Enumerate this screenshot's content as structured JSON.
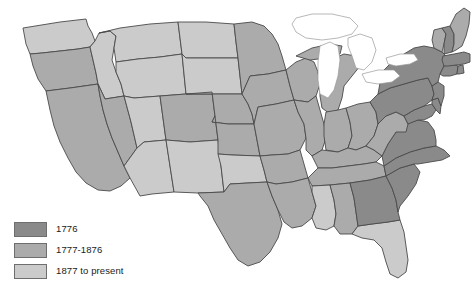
{
  "map": {
    "title": "United States statehood era choropleth",
    "background_color": "#ffffff",
    "border_color": "#4a4a4a",
    "lake_fill": "#ffffff",
    "categories": [
      {
        "key": "era1776",
        "label": "1776",
        "color": "#8a8a8a"
      },
      {
        "key": "era1777",
        "label": "1777-1876",
        "color": "#ababab"
      },
      {
        "key": "era1877",
        "label": "1877 to present",
        "color": "#cbcbcb"
      }
    ],
    "states": [
      {
        "code": "WA",
        "name": "Washington",
        "era": "era1877"
      },
      {
        "code": "OR",
        "name": "Oregon",
        "era": "era1777"
      },
      {
        "code": "CA",
        "name": "California",
        "era": "era1777"
      },
      {
        "code": "ID",
        "name": "Idaho",
        "era": "era1877"
      },
      {
        "code": "NV",
        "name": "Nevada",
        "era": "era1777"
      },
      {
        "code": "MT",
        "name": "Montana",
        "era": "era1877"
      },
      {
        "code": "WY",
        "name": "Wyoming",
        "era": "era1877"
      },
      {
        "code": "UT",
        "name": "Utah",
        "era": "era1877"
      },
      {
        "code": "AZ",
        "name": "Arizona",
        "era": "era1877"
      },
      {
        "code": "CO",
        "name": "Colorado",
        "era": "era1777"
      },
      {
        "code": "NM",
        "name": "New Mexico",
        "era": "era1877"
      },
      {
        "code": "ND",
        "name": "North Dakota",
        "era": "era1877"
      },
      {
        "code": "SD",
        "name": "South Dakota",
        "era": "era1877"
      },
      {
        "code": "NE",
        "name": "Nebraska",
        "era": "era1777"
      },
      {
        "code": "KS",
        "name": "Kansas",
        "era": "era1777"
      },
      {
        "code": "OK",
        "name": "Oklahoma",
        "era": "era1877"
      },
      {
        "code": "TX",
        "name": "Texas",
        "era": "era1777"
      },
      {
        "code": "MN",
        "name": "Minnesota",
        "era": "era1777"
      },
      {
        "code": "IA",
        "name": "Iowa",
        "era": "era1777"
      },
      {
        "code": "MO",
        "name": "Missouri",
        "era": "era1777"
      },
      {
        "code": "AR",
        "name": "Arkansas",
        "era": "era1777"
      },
      {
        "code": "LA",
        "name": "Louisiana",
        "era": "era1777"
      },
      {
        "code": "WI",
        "name": "Wisconsin",
        "era": "era1777"
      },
      {
        "code": "IL",
        "name": "Illinois",
        "era": "era1777"
      },
      {
        "code": "MI",
        "name": "Michigan",
        "era": "era1777"
      },
      {
        "code": "IN",
        "name": "Indiana",
        "era": "era1777"
      },
      {
        "code": "OH",
        "name": "Ohio",
        "era": "era1777"
      },
      {
        "code": "KY",
        "name": "Kentucky",
        "era": "era1777"
      },
      {
        "code": "TN",
        "name": "Tennessee",
        "era": "era1777"
      },
      {
        "code": "MS",
        "name": "Mississippi",
        "era": "era1877"
      },
      {
        "code": "AL",
        "name": "Alabama",
        "era": "era1777"
      },
      {
        "code": "FL",
        "name": "Florida",
        "era": "era1877"
      },
      {
        "code": "GA",
        "name": "Georgia",
        "era": "era1776"
      },
      {
        "code": "SC",
        "name": "South Carolina",
        "era": "era1776"
      },
      {
        "code": "NC",
        "name": "North Carolina",
        "era": "era1776"
      },
      {
        "code": "VA",
        "name": "Virginia",
        "era": "era1776"
      },
      {
        "code": "WV",
        "name": "West Virginia",
        "era": "era1777"
      },
      {
        "code": "MD",
        "name": "Maryland",
        "era": "era1776"
      },
      {
        "code": "DE",
        "name": "Delaware",
        "era": "era1776"
      },
      {
        "code": "PA",
        "name": "Pennsylvania",
        "era": "era1776"
      },
      {
        "code": "NJ",
        "name": "New Jersey",
        "era": "era1776"
      },
      {
        "code": "NY",
        "name": "New York",
        "era": "era1776"
      },
      {
        "code": "CT",
        "name": "Connecticut",
        "era": "era1776"
      },
      {
        "code": "RI",
        "name": "Rhode Island",
        "era": "era1776"
      },
      {
        "code": "MA",
        "name": "Massachusetts",
        "era": "era1776"
      },
      {
        "code": "VT",
        "name": "Vermont",
        "era": "era1777"
      },
      {
        "code": "NH",
        "name": "New Hampshire",
        "era": "era1776"
      },
      {
        "code": "ME",
        "name": "Maine",
        "era": "era1777"
      }
    ],
    "lakes": [
      "Lake Superior",
      "Lake Michigan",
      "Lake Huron",
      "Lake Erie",
      "Lake Ontario"
    ]
  },
  "legend": {
    "items": [
      {
        "label": "1776",
        "color": "#8a8a8a"
      },
      {
        "label": "1777-1876",
        "color": "#ababab"
      },
      {
        "label": "1877 to present",
        "color": "#cbcbcb"
      }
    ]
  }
}
